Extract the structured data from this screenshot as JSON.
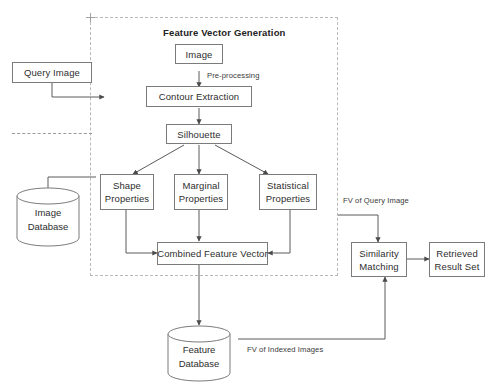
{
  "diagram": {
    "title": "Feature Vector Generation",
    "group": {
      "label": "Feature Vector Generation"
    },
    "nodes": {
      "query_image": "Query Image",
      "image": "Image",
      "contour_extraction": "Contour Extraction",
      "silhouette": "Silhouette",
      "shape_properties_l1": "Shape",
      "shape_properties_l2": "Properties",
      "marginal_properties_l1": "Marginal",
      "marginal_properties_l2": "Properties",
      "statistical_properties_l1": "Statistical",
      "statistical_properties_l2": "Properties",
      "combined_feature_vector": "Combined Feature Vector",
      "similarity_matching_l1": "Similarity",
      "similarity_matching_l2": "Matching",
      "retrieved_result_set_l1": "Retrieved",
      "retrieved_result_set_l2": "Result Set"
    },
    "databases": {
      "image_database_l1": "Image",
      "image_database_l2": "Database",
      "feature_database_l1": "Feature",
      "feature_database_l2": "Database"
    },
    "edge_labels": {
      "pre_processing": "Pre-processing",
      "fv_of_query_image": "FV of Query Image",
      "fv_of_indexed_images": "FV of Indexed Images"
    },
    "colors": {
      "stroke": "#7b7b7b",
      "wire": "#5a5a5a",
      "dashed_group": "#b9b9b9",
      "text": "#2e2e2e",
      "background": "#ffffff"
    }
  }
}
